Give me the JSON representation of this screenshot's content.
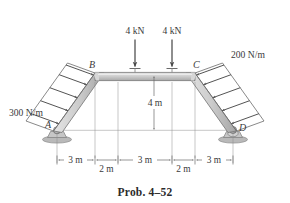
{
  "figure": {
    "caption": "Prob. 4–52",
    "background": "#ffffff",
    "member_fill": "#c9c9c9",
    "member_stroke": "#6e6e6e",
    "line_color": "#6b6b6b",
    "text_color": "#3a3a3a"
  },
  "joints": {
    "a": "A",
    "b": "B",
    "c": "C",
    "d": "D"
  },
  "loads": {
    "point_left": "4 kN",
    "point_right": "4 kN",
    "distributed_left": "300 N/m",
    "distributed_right": "200 N/m"
  },
  "dimensions": {
    "h1": "3 m",
    "h2": "2 m",
    "h3": "3 m",
    "h4": "2 m",
    "h5": "3 m",
    "vertical": "4 m"
  },
  "supports": {
    "a_type": "pin-support",
    "d_type": "rocker-support"
  }
}
